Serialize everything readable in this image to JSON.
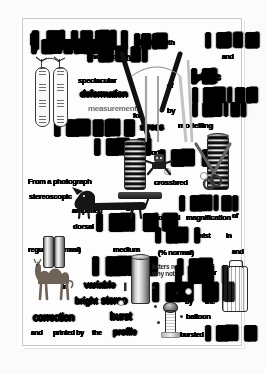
{
  "document": {
    "kind": "degraded-scanned-page",
    "background_color": "#fbfbfb",
    "page_color": "#fdfdfd",
    "border_color": "#c9c9c9",
    "ink_color": "#0a0a0a"
  },
  "text_fragments": [
    {
      "id": "f01",
      "text": "heading-blob",
      "legible": ""
    },
    {
      "id": "f02",
      "text": "morphology",
      "legible": "morphology"
    },
    {
      "id": "f03",
      "text": "tripod",
      "legible": "tripod"
    },
    {
      "id": "f04",
      "text": "with",
      "legible": "with"
    },
    {
      "id": "f05",
      "text": "instrument",
      "legible": ""
    },
    {
      "id": "f06",
      "text": "and",
      "legible": "and"
    },
    {
      "id": "f07",
      "text": "spectacular",
      "legible": "spectacular"
    },
    {
      "id": "f08",
      "text": "deformation",
      "legible": "deformation"
    },
    {
      "id": "f09",
      "text": "of",
      "legible": "of"
    },
    {
      "id": "f10",
      "text": "plastic",
      "legible": "plastic"
    },
    {
      "id": "f11",
      "text": "structure",
      "legible": ""
    },
    {
      "id": "f12",
      "text": "measurement",
      "legible": "measurement"
    },
    {
      "id": "f13",
      "text": "for",
      "legible": "for"
    },
    {
      "id": "f14",
      "text": "photoelastic",
      "legible": ""
    },
    {
      "id": "f15",
      "text": "by",
      "legible": "by"
    },
    {
      "id": "f16",
      "text": "compression",
      "legible": ""
    },
    {
      "id": "f17",
      "text": "stress",
      "legible": "stress"
    },
    {
      "id": "f18",
      "text": "modelling",
      "legible": "modelling"
    },
    {
      "id": "f19",
      "text": "work.",
      "legible": "work."
    },
    {
      "id": "f20",
      "text": "hyperbolic",
      "legible": ""
    },
    {
      "id": "f21",
      "text": "From a photograph",
      "legible": "From a photograph"
    },
    {
      "id": "f22",
      "text": "stereoscopic",
      "legible": "stereoscopic"
    },
    {
      "id": "f23",
      "text": "crossbred",
      "legible": "crossbred"
    },
    {
      "id": "f24",
      "text": "of",
      "legible": "of"
    },
    {
      "id": "f25",
      "text": "amplified",
      "legible": "amplified"
    },
    {
      "id": "f26",
      "text": "by",
      "legible": "by"
    },
    {
      "id": "f27",
      "text": "dorsal",
      "legible": "dorsal"
    },
    {
      "id": "f28",
      "text": "thickness",
      "legible": ""
    },
    {
      "id": "f29",
      "text": "optical",
      "legible": "optical"
    },
    {
      "id": "f30",
      "text": "magnification",
      "legible": "magnification"
    },
    {
      "id": "f31",
      "text": "of",
      "legible": "of"
    },
    {
      "id": "f32",
      "text": "regular (normal)",
      "legible": "regular (normal)"
    },
    {
      "id": "f33",
      "text": "medium",
      "legible": "medium"
    },
    {
      "id": "f34",
      "text": "support",
      "legible": ""
    },
    {
      "id": "f35",
      "text": "exist",
      "legible": "exist"
    },
    {
      "id": "f36",
      "text": "in",
      "legible": "in"
    },
    {
      "id": "f37",
      "text": "(% normal)",
      "legible": "(% normal)"
    },
    {
      "id": "f38",
      "text": "and",
      "legible": "and"
    },
    {
      "id": "f39",
      "text": "letters not",
      "legible": "letters not"
    },
    {
      "id": "f40",
      "text": "flattened",
      "legible": ""
    },
    {
      "id": "f41",
      "text": "or",
      "legible": "or"
    },
    {
      "id": "f42",
      "text": "in",
      "legible": "in"
    },
    {
      "id": "f43",
      "text": "variable",
      "legible": "variable"
    },
    {
      "id": "f44",
      "text": "here",
      "legible": ""
    },
    {
      "id": "f45",
      "text": "why not",
      "legible": "why not"
    },
    {
      "id": "f46",
      "text": "natural",
      "legible": ""
    },
    {
      "id": "f47",
      "text": "or",
      "legible": "or"
    },
    {
      "id": "f48",
      "text": "photographic",
      "legible": ""
    },
    {
      "id": "f49",
      "text": "bright",
      "legible": "bright"
    },
    {
      "id": "f50",
      "text": "stereo",
      "legible": "stereo"
    },
    {
      "id": "f51",
      "text": "by",
      "legible": "by"
    },
    {
      "id": "f52",
      "text": "the",
      "legible": "the"
    },
    {
      "id": "f53",
      "text": "correction",
      "legible": "correction"
    },
    {
      "id": "f54",
      "text": "burst",
      "legible": "burst"
    },
    {
      "id": "f55",
      "text": "balloon",
      "legible": "balloon"
    },
    {
      "id": "f56",
      "text": "and",
      "legible": "and"
    },
    {
      "id": "f57",
      "text": "printed by",
      "legible": "printed by"
    },
    {
      "id": "f58",
      "text": "the",
      "legible": "the"
    },
    {
      "id": "f59",
      "text": "profile",
      "legible": "profile"
    },
    {
      "id": "f60",
      "text": "bursted",
      "legible": "bursted"
    },
    {
      "id": "f61",
      "text": "photographs",
      "legible": ""
    }
  ],
  "illustrations": [
    {
      "id": "i01",
      "name": "twin-test-tube-thermometer-pair"
    },
    {
      "id": "i02",
      "name": "coil-spring"
    },
    {
      "id": "i03",
      "name": "scissors"
    },
    {
      "id": "i04",
      "name": "dachshund-dog"
    },
    {
      "id": "i05",
      "name": "camel"
    },
    {
      "id": "i06",
      "name": "suitcase"
    },
    {
      "id": "i07",
      "name": "ribbed-cylinder"
    },
    {
      "id": "i08",
      "name": "desk-lamp"
    },
    {
      "id": "i09",
      "name": "crossing-strut-lines"
    },
    {
      "id": "i10",
      "name": "ink-speckles"
    }
  ]
}
